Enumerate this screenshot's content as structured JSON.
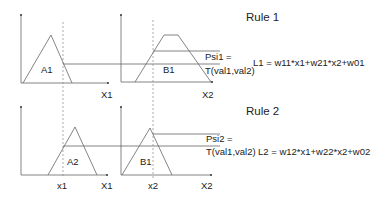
{
  "diagram": {
    "type": "fuzzy-inference-rules",
    "colors": {
      "line": "#666666",
      "dashed": "#888888",
      "text": "#222222"
    },
    "rules": [
      {
        "title": "Rule 1",
        "input1_set": "A1",
        "input1_axis": "X1",
        "input2_set": "B1",
        "input2_axis": "X2",
        "firing_label_line1": "Psi1 =",
        "firing_label_line2": "T(val1,val2)",
        "output": "L1 = w11*x1+w21*x2+w01"
      },
      {
        "title": "Rule 2",
        "input1_set": "A2",
        "input1_axis": "X1",
        "input1_value": "x1",
        "input2_set": "B1",
        "input2_axis": "X2",
        "input2_value": "x2",
        "firing_label_line1": "Psi2 =",
        "firing_label_line2": "T(val1,val2)",
        "output": "L2 = w12*x1+w22*x2+w02"
      }
    ]
  }
}
